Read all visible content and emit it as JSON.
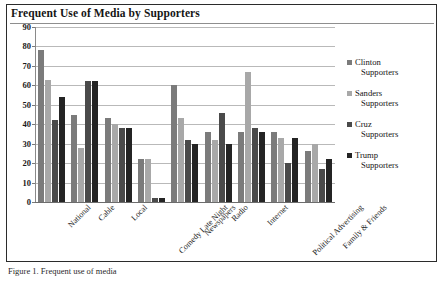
{
  "figure": {
    "title": "Frequent Use of Media by Supporters",
    "caption": "Figure 1. Frequent use of media"
  },
  "chart_data": {
    "type": "bar",
    "title": "Frequent Use of Media by Supporters",
    "xlabel": "",
    "ylabel": "",
    "ylim": [
      0,
      90
    ],
    "ytick_step": 10,
    "yticks": [
      0,
      10,
      20,
      30,
      40,
      50,
      60,
      70,
      80,
      90
    ],
    "grid": true,
    "legend_position": "right",
    "categories": [
      "National",
      "Cable",
      "Local",
      "Comedy Late Night",
      "Newspapers",
      "Radio",
      "Internet",
      "Political Advertising",
      "Family & Friends"
    ],
    "series": [
      {
        "name": "Clinton Supporters",
        "color": "#7b7b7b",
        "values": [
          78,
          45,
          43,
          22,
          60,
          36,
          36,
          36,
          26
        ]
      },
      {
        "name": "Sanders Supporters",
        "color": "#a8a8a8",
        "values": [
          63,
          28,
          40,
          22,
          43,
          32,
          67,
          33,
          30
        ]
      },
      {
        "name": "Cruz Supporters",
        "color": "#4a4a4a",
        "values": [
          42,
          62,
          38,
          2,
          32,
          46,
          38,
          20,
          17
        ]
      },
      {
        "name": "Trump Supporters",
        "color": "#242424",
        "values": [
          54,
          62,
          38,
          2,
          30,
          30,
          36,
          33,
          22
        ]
      }
    ]
  },
  "legend": {
    "items": [
      {
        "key": "clinton",
        "line1": "Clinton",
        "line2": "Supporters"
      },
      {
        "key": "sanders",
        "line1": "Sanders",
        "line2": "Supporters"
      },
      {
        "key": "cruz",
        "line1": "Cruz",
        "line2": "Supporters"
      },
      {
        "key": "trump",
        "line1": "Trump",
        "line2": "Supporters"
      }
    ]
  }
}
